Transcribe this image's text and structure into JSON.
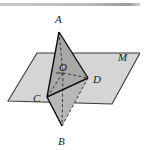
{
  "figure": {
    "type": "geometry-diagram",
    "background_color": "#ffffff",
    "top_rule": {
      "present": true,
      "color": "#b4b4b4",
      "x_start": 0,
      "x_end": 141,
      "y": 5
    },
    "plane": {
      "label": "M",
      "label_x": 118,
      "label_y": 61,
      "fill_color": "#d5d5d5",
      "stroke_color": "#3a3a3a",
      "corners": [
        {
          "x": 8,
          "y": 101
        },
        {
          "x": 37,
          "y": 53
        },
        {
          "x": 140,
          "y": 53
        },
        {
          "x": 112,
          "y": 104
        }
      ]
    },
    "shaded_triangle": {
      "name": "ACD",
      "fill_color": "#a8a8a8",
      "stroke_color": "#1a1a1a",
      "points": [
        {
          "x": 59,
          "y": 32
        },
        {
          "x": 47,
          "y": 97
        },
        {
          "x": 88,
          "y": 78
        }
      ]
    },
    "lower_triangle": {
      "name": "CBD",
      "fill_color": "#b8b8b8",
      "stroke_color": "#1a1a1a",
      "points": [
        {
          "x": 47,
          "y": 97
        },
        {
          "x": 62,
          "y": 126
        },
        {
          "x": 88,
          "y": 78
        }
      ]
    },
    "vertices": [
      {
        "id": "A",
        "label": "A",
        "x": 59,
        "y": 32,
        "label_x": 55,
        "label_y": 23
      },
      {
        "id": "B",
        "label": "B",
        "x": 62,
        "y": 126,
        "label_x": 58,
        "label_y": 145
      },
      {
        "id": "C",
        "label": "C",
        "x": 47,
        "y": 97,
        "label_x": 33,
        "label_y": 102
      },
      {
        "id": "D",
        "label": "D",
        "x": 88,
        "y": 78,
        "label_x": 93,
        "label_y": 83
      },
      {
        "id": "O",
        "label": "O",
        "x": 63,
        "y": 73,
        "label_x": 59,
        "label_y": 71
      }
    ],
    "solid_edges": [
      {
        "from": "A",
        "to": "C"
      },
      {
        "from": "A",
        "to": "D"
      },
      {
        "from": "C",
        "to": "D"
      },
      {
        "from": "C",
        "to": "B"
      },
      {
        "from": "B",
        "to": "D"
      }
    ],
    "dashed_edges": [
      {
        "from": "A",
        "to": "O"
      },
      {
        "from": "O",
        "to": "B"
      },
      {
        "from": "O",
        "to": "C"
      },
      {
        "from": "O",
        "to": "D"
      },
      {
        "from": "C",
        "to": "B"
      },
      {
        "from": "B",
        "to": "D"
      }
    ]
  }
}
